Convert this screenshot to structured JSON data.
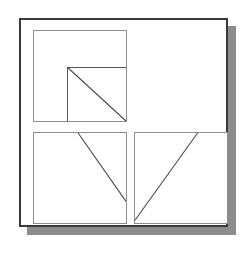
{
  "figure": {
    "background_color": "#ffffff",
    "frame": {
      "border_color": "#3a3a3a",
      "border_width_px": 2,
      "shadow_color": "#8c8c8c",
      "shadow_offset_px": 8,
      "x": 19,
      "y": 18,
      "width": 209,
      "height": 209
    },
    "panel_border_color": "#8e8e8e",
    "line_color": "#4a4a4a"
  },
  "panels": [
    {
      "id": "panel-1",
      "position": "top-left",
      "x": 12,
      "y": 10,
      "width": 94,
      "height": 92,
      "has_sub_square": true,
      "sub_square": {
        "left_pct": 36,
        "top_pct": 40,
        "description": "inner square occupying the lower-right region of the panel"
      },
      "diagonals": [
        {
          "name": "descending-diagonal",
          "x1_pct": 36,
          "y1_pct": 40,
          "x2_pct": 100,
          "y2_pct": 100,
          "direction": "top-left to bottom-right"
        }
      ]
    },
    {
      "id": "panel-2",
      "position": "bottom-left",
      "x": 12,
      "y": 112,
      "width": 94,
      "height": 92,
      "has_sub_square": false,
      "diagonals": [
        {
          "name": "descending-diagonal",
          "x1_pct": 48,
          "y1_pct": 0,
          "x2_pct": 100,
          "y2_pct": 76,
          "direction": "top edge to right edge, sloping down"
        }
      ]
    },
    {
      "id": "panel-3",
      "position": "bottom-right",
      "x": 113,
      "y": 112,
      "width": 94,
      "height": 92,
      "has_sub_square": false,
      "diagonals": [
        {
          "name": "ascending-diagonal",
          "x1_pct": 0,
          "y1_pct": 97,
          "x2_pct": 68,
          "y2_pct": 0,
          "direction": "left edge to top edge, sloping up"
        }
      ]
    }
  ]
}
